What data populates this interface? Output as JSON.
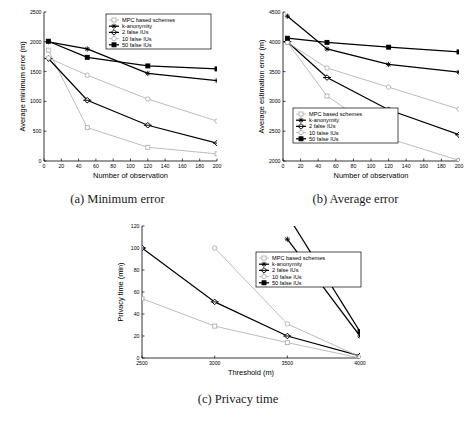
{
  "figure": {
    "panels": [
      {
        "id": "a",
        "caption": "(a) Minimum error"
      },
      {
        "id": "b",
        "caption": "(b) Average error"
      },
      {
        "id": "c",
        "caption": "(c) Privacy time"
      }
    ]
  },
  "legend_labels": {
    "mpc": "MPC based schemes",
    "kanon": "k-anonymity",
    "iu2": "2 false IUs",
    "iu10": "10 false IUs",
    "iu50": "50 false IUs"
  },
  "colors": {
    "light_gray": "#b0b0b0",
    "mid_gray": "#9a9a9a",
    "black": "#000000",
    "axis": "#000000",
    "background": "#ffffff"
  },
  "chart_data": [
    {
      "type": "line",
      "panel": "a",
      "title": "(a) Minimum error",
      "xlabel": "Number of observation",
      "ylabel": "Average minimum error (m)",
      "xlim": [
        0,
        200
      ],
      "ylim": [
        0,
        2500
      ],
      "xticks": [
        0,
        20,
        40,
        60,
        80,
        100,
        120,
        140,
        160,
        180,
        200
      ],
      "yticks": [
        0,
        500,
        1000,
        1500,
        2000,
        2500
      ],
      "grid": false,
      "legend_position": "top-right",
      "x": [
        5,
        50,
        120,
        200
      ],
      "series": [
        {
          "name": "MPC based schemes",
          "marker": "square",
          "color": "#b0b0b0",
          "values": [
            1860,
            560,
            230,
            120
          ]
        },
        {
          "name": "k-anonymity",
          "marker": "star",
          "color": "#000000",
          "values": [
            2000,
            1880,
            1470,
            1350
          ]
        },
        {
          "name": "2 false IUs",
          "marker": "diamond",
          "color": "#000000",
          "values": [
            1720,
            1020,
            600,
            300
          ]
        },
        {
          "name": "10 false IUs",
          "marker": "circle",
          "color": "#b0b0b0",
          "values": [
            1730,
            1440,
            1040,
            670
          ]
        },
        {
          "name": "50 false IUs",
          "marker": "filled-square",
          "color": "#000000",
          "values": [
            2010,
            1740,
            1595,
            1545
          ]
        }
      ]
    },
    {
      "type": "line",
      "panel": "b",
      "title": "(b) Average error",
      "xlabel": "Number of observation",
      "ylabel": "Average estimation error (m)",
      "xlim": [
        0,
        200
      ],
      "ylim": [
        2000,
        4500
      ],
      "xticks": [
        0,
        20,
        40,
        60,
        80,
        100,
        120,
        140,
        160,
        180,
        200
      ],
      "yticks": [
        2000,
        2500,
        3000,
        3500,
        4000,
        4500
      ],
      "grid": false,
      "legend_position": "bottom-left",
      "x": [
        5,
        50,
        120,
        200
      ],
      "series": [
        {
          "name": "MPC based schemes",
          "marker": "square",
          "color": "#b0b0b0",
          "values": [
            3990,
            3090,
            2380,
            2010
          ]
        },
        {
          "name": "k-anonymity",
          "marker": "star",
          "color": "#000000",
          "values": [
            4430,
            3880,
            3620,
            3490
          ]
        },
        {
          "name": "2 false IUs",
          "marker": "diamond",
          "color": "#000000",
          "values": [
            4000,
            3400,
            2860,
            2440
          ]
        },
        {
          "name": "10 false IUs",
          "marker": "circle",
          "color": "#b0b0b0",
          "values": [
            3990,
            3560,
            3240,
            2870
          ]
        },
        {
          "name": "50 false IUs",
          "marker": "filled-square",
          "color": "#000000",
          "values": [
            4060,
            3990,
            3910,
            3830
          ]
        }
      ]
    },
    {
      "type": "line",
      "panel": "c",
      "title": "(c) Privacy time",
      "xlabel": "Threshold (m)",
      "ylabel": "Privacy time (min)",
      "xlim": [
        2500,
        4000
      ],
      "ylim": [
        0,
        120
      ],
      "xticks": [
        2500,
        3000,
        3500,
        4000
      ],
      "yticks": [
        0,
        20,
        40,
        60,
        80,
        100,
        120
      ],
      "grid": false,
      "legend_position": "top-right",
      "x": [
        2500,
        3000,
        3500,
        4000
      ],
      "series": [
        {
          "name": "MPC based schemes",
          "marker": "square",
          "color": "#b0b0b0",
          "values": [
            54,
            29,
            14,
            0
          ]
        },
        {
          "name": "k-anonymity",
          "marker": "star",
          "color": "#000000",
          "values": [
            null,
            null,
            108,
            20
          ]
        },
        {
          "name": "2 false IUs",
          "marker": "diamond",
          "color": "#000000",
          "values": [
            100,
            51,
            20,
            2
          ]
        },
        {
          "name": "10 false IUs",
          "marker": "circle",
          "color": "#b0b0b0",
          "values": [
            null,
            100,
            31,
            1
          ]
        },
        {
          "name": "50 false IUs",
          "marker": "filled-square",
          "color": "#000000",
          "values": [
            null,
            null,
            130,
            24
          ]
        }
      ]
    }
  ]
}
